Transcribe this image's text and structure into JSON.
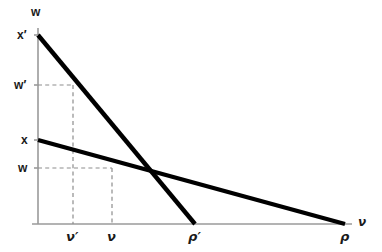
{
  "figure": {
    "background_color": "#ffffff",
    "width": 382,
    "height": 252
  },
  "axes": {
    "y_axis_label": "w",
    "x_axis_label": "ν",
    "axis_color": "#9a9a9a",
    "origin_x": 38,
    "origin_y": 224,
    "y_axis_top": 28,
    "x_axis_right": 352
  },
  "y_ticks": [
    {
      "label": "x′",
      "y": 35
    },
    {
      "label": "w′",
      "y": 85
    },
    {
      "label": "x",
      "y": 140
    },
    {
      "label": "w",
      "y": 168
    }
  ],
  "x_ticks": [
    {
      "label": "ν′",
      "x": 73
    },
    {
      "label": "ν",
      "x": 112
    },
    {
      "label": "ρ′",
      "x": 195
    },
    {
      "label": "ρ",
      "x": 345
    }
  ],
  "chart_data": {
    "type": "line",
    "title": "",
    "xlabel": "ν",
    "ylabel": "w",
    "grid": false,
    "legend": "none",
    "line_color": "#000000",
    "guide_color": "#8d8d8d",
    "series": [
      {
        "name": "steep-demand-line",
        "intercept_label": "x′",
        "x_intercept_label": "ρ′",
        "points": [
          {
            "x": 38,
            "y": 35
          },
          {
            "x": 195,
            "y": 224
          }
        ]
      },
      {
        "name": "flat-demand-line",
        "intercept_label": "x",
        "x_intercept_label": "ρ",
        "points": [
          {
            "x": 38,
            "y": 140
          },
          {
            "x": 345,
            "y": 224
          }
        ]
      }
    ],
    "guides": [
      {
        "name": "w-prime-guide",
        "horizontal": {
          "x1": 38,
          "y1": 85,
          "x2": 73,
          "y2": 85
        },
        "vertical": {
          "x1": 73,
          "y1": 85,
          "x2": 73,
          "y2": 224
        }
      },
      {
        "name": "w-guide",
        "horizontal": {
          "x1": 38,
          "y1": 168,
          "x2": 112,
          "y2": 168
        },
        "vertical": {
          "x1": 112,
          "y1": 168,
          "x2": 112,
          "y2": 224
        }
      }
    ],
    "intersection": {
      "x": 135,
      "y": 170
    },
    "annotations": [
      "x′ is the vertical intercept of the steep line",
      "x is the vertical intercept of the flat line",
      "ρ′ is the horizontal intercept of the steep line",
      "ρ is the horizontal intercept of the flat line"
    ]
  }
}
